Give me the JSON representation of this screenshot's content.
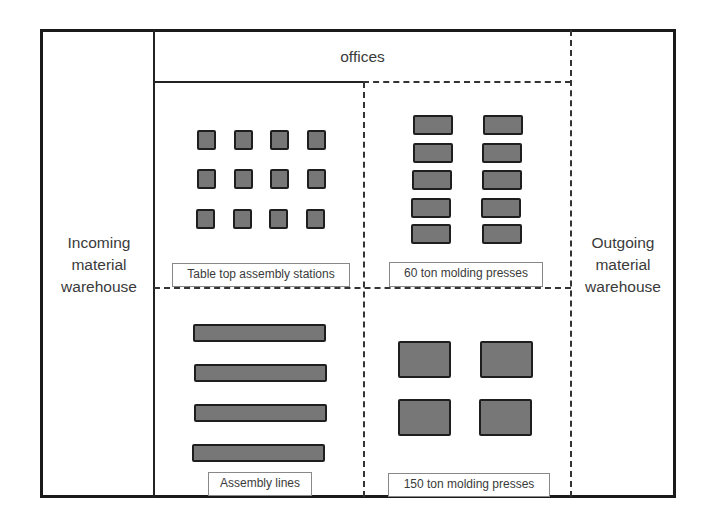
{
  "diagram": {
    "type": "factory floor layout",
    "zones": {
      "offices": "offices",
      "incoming": {
        "line1": "Incoming",
        "line2": "material",
        "line3": "warehouse"
      },
      "outgoing": {
        "line1": "Outgoing",
        "line2": "material",
        "line3": "warehouse"
      }
    },
    "cells": [
      {
        "label": "Table top assembly stations",
        "machine_count": 12
      },
      {
        "label": "60 ton molding presses",
        "machine_count": 10
      },
      {
        "label": "Assembly lines",
        "machine_count": 4
      },
      {
        "label": "150 ton molding presses",
        "machine_count": 4
      }
    ],
    "colors": {
      "machine_fill": "#777777",
      "machine_border": "#1e1e1e",
      "wall": "#1a1a1a"
    }
  }
}
